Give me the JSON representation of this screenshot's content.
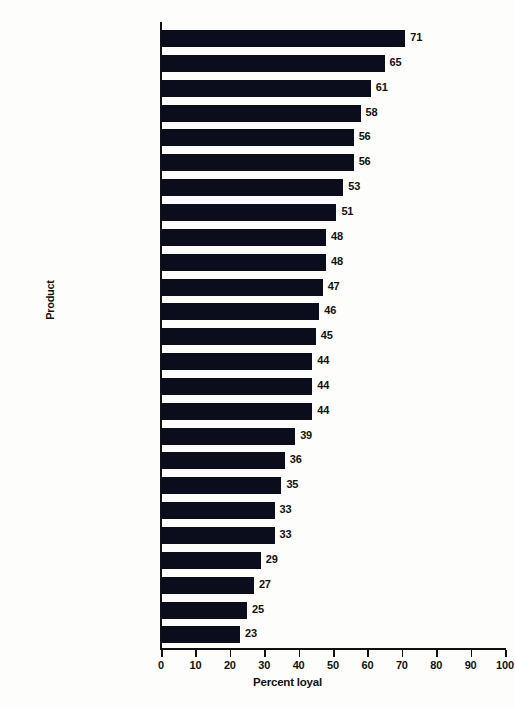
{
  "chart_data": {
    "type": "bar",
    "orientation": "horizontal",
    "title": "",
    "xlabel": "Percent loyal",
    "ylabel": "Product",
    "xlim": [
      0,
      100
    ],
    "xticks": [
      0,
      10,
      20,
      30,
      40,
      50,
      60,
      70,
      80,
      90,
      100
    ],
    "grid": false,
    "legend": null,
    "bar_color": "#0b0c1c",
    "categories": [
      "Cigarettes",
      "Mayonnaise",
      "Toothpaste",
      "Coffee",
      "Headache remedy",
      "Film",
      "Bath soap",
      "Ketchup",
      "Laundry detergent",
      "Beer",
      "Automobile",
      "Perfume/after shave",
      "Pet food",
      "Shampoo",
      "Soft drink",
      "Tuna fish",
      "Gasoline",
      "Underwear",
      "Television",
      "Tires",
      "Blue jeans",
      "Batteries",
      "Athletic shoes",
      "Canned vegetables",
      "Garbage bags"
    ],
    "values": [
      71,
      65,
      61,
      58,
      56,
      56,
      53,
      51,
      48,
      48,
      47,
      46,
      45,
      44,
      44,
      44,
      39,
      36,
      35,
      33,
      33,
      29,
      27,
      25,
      23
    ]
  }
}
